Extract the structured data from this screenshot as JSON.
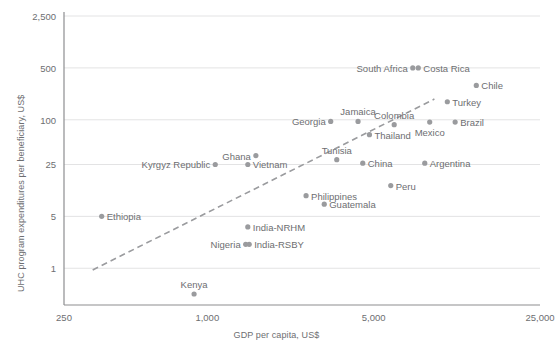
{
  "chart_data": {
    "type": "scatter",
    "title": "",
    "xlabel": "GDP per capita, US$",
    "ylabel": "UHC program expenditures per beneficiary, US$",
    "xscale": "log",
    "yscale": "log",
    "xlim": [
      250,
      25000
    ],
    "ylim": [
      0.32,
      2500
    ],
    "xticks": [
      250,
      1000,
      5000,
      25000
    ],
    "xtick_labels": [
      "250",
      "1,000",
      "5,000",
      "25,000"
    ],
    "yticks": [
      1,
      5,
      25,
      100,
      500,
      2500
    ],
    "ytick_labels": [
      "1",
      "5",
      "25",
      "100",
      "500",
      "2,500"
    ],
    "grid": "horizontal",
    "legend": "none",
    "point_color": "#9a9b9e",
    "trendline": {
      "style": "dashed",
      "color": "#9a9b9e",
      "x": [
        330,
        9000
      ],
      "y": [
        0.95,
        190
      ]
    },
    "points": [
      {
        "label": "Ethiopia",
        "x": 360,
        "y": 5,
        "label_pos": "right"
      },
      {
        "label": "Kenya",
        "x": 880,
        "y": 0.45,
        "label_pos": "above"
      },
      {
        "label": "Nigeria",
        "x": 1450,
        "y": 2.1,
        "label_pos": "left"
      },
      {
        "label": "India-RSBY",
        "x": 1500,
        "y": 2.1,
        "label_pos": "right"
      },
      {
        "label": "India-NRHM",
        "x": 1480,
        "y": 3.6,
        "label_pos": "right"
      },
      {
        "label": "Kyrgyz Republic",
        "x": 1080,
        "y": 25,
        "label_pos": "left"
      },
      {
        "label": "Vietnam",
        "x": 1480,
        "y": 25,
        "label_pos": "right"
      },
      {
        "label": "Ghana",
        "x": 1600,
        "y": 33,
        "label_pos": "left"
      },
      {
        "label": "Philippines",
        "x": 2600,
        "y": 9.5,
        "label_pos": "right"
      },
      {
        "label": "Guatemala",
        "x": 3100,
        "y": 7.3,
        "label_pos": "right"
      },
      {
        "label": "Georgia",
        "x": 3300,
        "y": 95,
        "label_pos": "left"
      },
      {
        "label": "Tunisia",
        "x": 3500,
        "y": 29,
        "label_pos": "above"
      },
      {
        "label": "Jamaica",
        "x": 4300,
        "y": 95,
        "label_pos": "above"
      },
      {
        "label": "China",
        "x": 4500,
        "y": 26,
        "label_pos": "right"
      },
      {
        "label": "Thailand",
        "x": 4800,
        "y": 63,
        "label_pos": "right"
      },
      {
        "label": "Peru",
        "x": 5900,
        "y": 13,
        "label_pos": "right"
      },
      {
        "label": "Colombia",
        "x": 6100,
        "y": 86,
        "label_pos": "above"
      },
      {
        "label": "South Africa",
        "x": 7300,
        "y": 500,
        "label_pos": "left"
      },
      {
        "label": "Costa Rica",
        "x": 7700,
        "y": 500,
        "label_pos": "right"
      },
      {
        "label": "Argentina",
        "x": 8200,
        "y": 26,
        "label_pos": "right"
      },
      {
        "label": "Mexico",
        "x": 8600,
        "y": 93,
        "label_pos": "below"
      },
      {
        "label": "Turkey",
        "x": 10200,
        "y": 175,
        "label_pos": "right"
      },
      {
        "label": "Brazil",
        "x": 11000,
        "y": 93,
        "label_pos": "right"
      },
      {
        "label": "Chile",
        "x": 13500,
        "y": 290,
        "label_pos": "right"
      }
    ]
  }
}
